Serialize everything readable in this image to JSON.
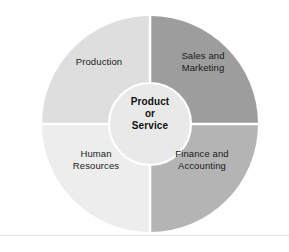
{
  "diagram": {
    "center": {
      "line1": "Product",
      "line2": "or",
      "line3": "Service",
      "text": "Product\nor\nService",
      "fill": "#e9e9e9",
      "stroke": "#ffffff"
    },
    "quadrants": [
      {
        "id": "production",
        "label": "Production",
        "position": "top-left",
        "fill": "#dedede"
      },
      {
        "id": "sales-and-marketing",
        "label": "Sales and\nMarketing",
        "position": "top-right",
        "fill": "#9d9d9d"
      },
      {
        "id": "human-resources",
        "label": "Human\nResources",
        "position": "bottom-left",
        "fill": "#ededed"
      },
      {
        "id": "finance-and-accounting",
        "label": "Finance and\nAccounting",
        "position": "bottom-right",
        "fill": "#b4b4b4"
      }
    ],
    "divider_color": "#ffffff",
    "background": "#ffffff",
    "rule_color": "#e4e6e8"
  }
}
